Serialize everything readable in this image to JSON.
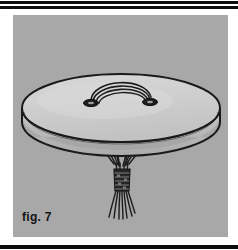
{
  "page": {
    "background_color": "#ffffff",
    "width": 238,
    "height": 250
  },
  "rules": {
    "color": "#0d0d0d",
    "top_outer_label": "top-outer-rule",
    "top_inner_label": "top-inner-rule",
    "bottom_label": "bottom-rule"
  },
  "figure": {
    "caption": "fig. 7",
    "panel_color": "#a8a8a8",
    "ink_color": "#1a1a1a",
    "drum": {
      "head_fill": "#cfcfcf",
      "rim_fill": "#bdbdbd",
      "shadow_fill": "#9a9a9a",
      "top_face_label": "drum-head",
      "rim_label": "drum-rim"
    },
    "handle": {
      "label": "carry-strap-loop",
      "strand_count": 3,
      "grommet_left_label": "grommet-left",
      "grommet_right_label": "grommet-right",
      "grommet_fill": "#1a1a1a"
    },
    "tassel": {
      "label": "cord-bundle-tassel",
      "cord_count": 6,
      "binding_label": "wrapped-binding",
      "fringe_count": 7
    }
  }
}
